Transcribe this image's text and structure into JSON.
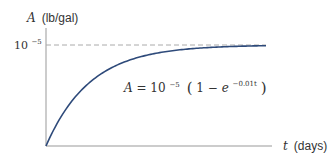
{
  "chart_data": {
    "type": "line",
    "title": "",
    "equation": {
      "prefix": "A = 10",
      "exponent": "−5",
      "body": "(1 − e",
      "inner_exponent": "−0.01t",
      "suffix": ")"
    },
    "ylabel": {
      "var": "A",
      "unit": "(lb/gal)"
    },
    "xlabel": {
      "var": "t",
      "unit": "(days)"
    },
    "yticks": [
      {
        "value": 1e-05,
        "base": "10",
        "exp": "−5"
      }
    ],
    "asymptote": {
      "value": 1e-05,
      "style": "dashed"
    },
    "xlim": [
      0,
      500
    ],
    "ylim": [
      0,
      1.2e-05
    ],
    "series": [
      {
        "name": "A(t)",
        "function": "1e-5*(1-exp(-0.01*t))",
        "color": "#2e4a7a"
      }
    ],
    "grid": false,
    "colors": {
      "curve": "#2e4a7a",
      "axis": "#999999",
      "dashed": "#aaaaaa",
      "text": "#333333"
    }
  }
}
